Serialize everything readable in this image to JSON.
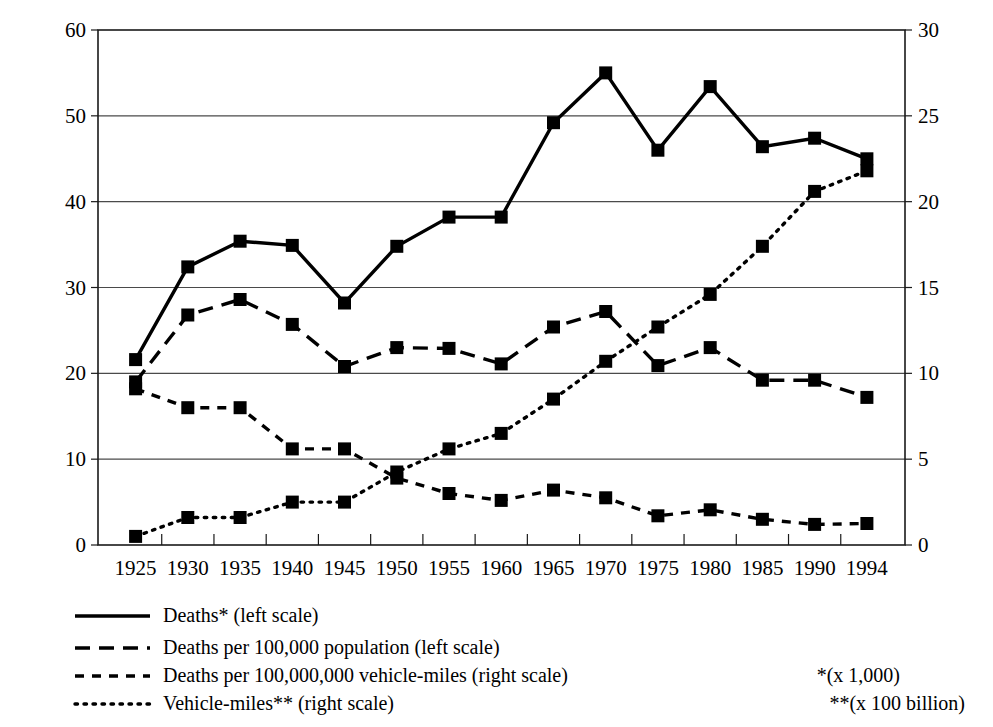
{
  "chart_data": {
    "type": "line",
    "title": "",
    "subtitle": "",
    "xlabel": "",
    "ylabel": "",
    "y2label": "",
    "grid": true,
    "legend_position": "below-left",
    "x": [
      1925,
      1930,
      1935,
      1940,
      1945,
      1950,
      1955,
      1960,
      1965,
      1970,
      1975,
      1980,
      1985,
      1990,
      1994
    ],
    "xticklabels": [
      "1925",
      "1930",
      "1935",
      "1940",
      "1945",
      "1950",
      "1955",
      "1960",
      "1965",
      "1970",
      "1975",
      "1980",
      "1985",
      "1990",
      "1994"
    ],
    "ylim": [
      0,
      60
    ],
    "yticks": [
      0,
      10,
      20,
      30,
      40,
      50,
      60
    ],
    "yticklabels": [
      "0",
      "10",
      "20",
      "30",
      "40",
      "50",
      "60"
    ],
    "y2lim": [
      0,
      30
    ],
    "y2ticks": [
      0,
      5,
      10,
      15,
      20,
      25,
      30
    ],
    "y2ticklabels": [
      "0",
      "5",
      "10",
      "15",
      "20",
      "25",
      "30"
    ],
    "series": [
      {
        "name": "Deaths* (left scale)",
        "axis": "left",
        "style": "solid",
        "marker": "square",
        "values": [
          21.6,
          32.4,
          35.4,
          34.9,
          28.2,
          34.8,
          38.2,
          38.2,
          49.2,
          55.0,
          46.0,
          53.4,
          46.4,
          47.4,
          45.0
        ]
      },
      {
        "name": "Deaths per 100,000 population (left scale)",
        "axis": "left",
        "style": "dashed-long",
        "marker": "square",
        "values": [
          19.0,
          26.8,
          28.6,
          25.7,
          20.8,
          23.0,
          22.9,
          21.1,
          25.4,
          27.2,
          20.9,
          23.0,
          19.2,
          19.2,
          17.2
        ]
      },
      {
        "name": "Deaths per 100,000,000 vehicle-miles (right scale)",
        "axis": "right",
        "style": "dashed-short",
        "marker": "square",
        "values": [
          9.1,
          8.0,
          8.0,
          5.6,
          5.6,
          3.9,
          3.0,
          2.6,
          3.2,
          2.75,
          1.7,
          2.05,
          1.5,
          1.2,
          1.25
        ]
      },
      {
        "name": "Vehicle-miles** (right scale)",
        "axis": "right",
        "style": "dotted",
        "marker": "square",
        "values": [
          0.5,
          1.6,
          1.6,
          2.5,
          2.5,
          4.25,
          5.6,
          6.5,
          8.5,
          10.7,
          12.7,
          14.6,
          17.4,
          20.6,
          21.8
        ]
      }
    ],
    "annotations": [
      "*(x 1,000)",
      "**(x 100 billion)"
    ]
  },
  "legend": {
    "items": [
      {
        "label": "Deaths* (left scale)",
        "style": "solid"
      },
      {
        "label": "Deaths per 100,000 population (left scale)",
        "style": "dashed-long"
      },
      {
        "label": "Deaths per 100,000,000 vehicle-miles (right scale)",
        "style": "dashed-short"
      },
      {
        "label": "Vehicle-miles** (right scale)",
        "style": "dotted"
      }
    ]
  },
  "notes": {
    "line1": "*(x 1,000)",
    "line2": "**(x 100 billion)"
  }
}
